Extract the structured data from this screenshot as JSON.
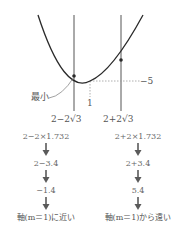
{
  "graph": {
    "min_label": "最小",
    "axis_label": "1",
    "min_value_label": "−5",
    "left_root_label": "2−2√3",
    "right_root_label": "2+2√3"
  },
  "columns": [
    {
      "steps": [
        "2−2×1.732",
        "2−3.4",
        "−1.4"
      ],
      "conclusion": "軸(m＝1)に近い"
    },
    {
      "steps": [
        "2+2×1.732",
        "2+3.4",
        "5.4"
      ],
      "conclusion": "軸(m＝1)から遠い"
    }
  ],
  "colors": {
    "curve": "#2a2a2a",
    "lines": "#555555",
    "dashed": "#999999",
    "arrow": "#5a5a5a",
    "text": "#555555"
  }
}
